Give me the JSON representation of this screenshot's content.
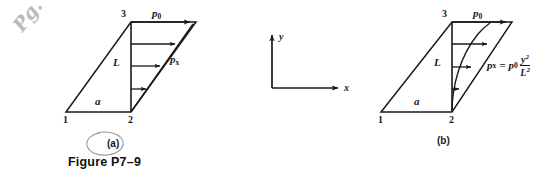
{
  "figure": {
    "caption": "Figure P7–9",
    "background_color": "#ffffff",
    "line_color": "#1a1a1a"
  },
  "annotation": {
    "handwritten_note": "Pg. 409",
    "handwritten_note_color": "#b9b9bd",
    "circled_label": "(a)"
  },
  "axes": {
    "y_label": "y",
    "x_label": "x"
  },
  "panels": [
    {
      "id": "a",
      "sublabel": "(a)",
      "node_labels": [
        "1",
        "2",
        "3"
      ],
      "side_label": "a",
      "height_label": "L",
      "peak_pressure_label": "p",
      "peak_pressure_sub": "0",
      "pressure_label": "p",
      "pressure_sub": "x",
      "distribution": "linear",
      "arrow_count": 4
    },
    {
      "id": "b",
      "sublabel": "(b)",
      "node_labels": [
        "1",
        "2",
        "3"
      ],
      "side_label": "a",
      "height_label": "L",
      "peak_pressure_label": "p",
      "peak_pressure_sub": "0",
      "equation": {
        "lhs": "p",
        "lhs_sub": "x",
        "equals": "=",
        "rhs_coeff": "p",
        "rhs_coeff_sub": "0",
        "numerator": "y",
        "numerator_exp": "2",
        "denominator": "L",
        "denominator_exp": "2"
      },
      "distribution": "parabolic",
      "arrow_count": 4
    }
  ]
}
